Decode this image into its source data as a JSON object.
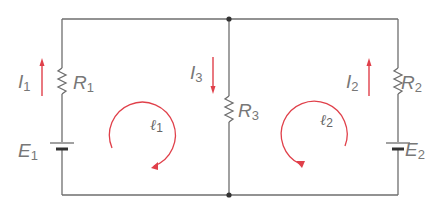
{
  "diagram": {
    "type": "circuit",
    "colors": {
      "wire": "#6e6e6e",
      "current": "#e0404a",
      "label": "#777777"
    },
    "components": {
      "R1": {
        "main": "R",
        "sub": "1"
      },
      "R2": {
        "main": "R",
        "sub": "2"
      },
      "R3": {
        "main": "R",
        "sub": "3"
      },
      "E1": {
        "main": "E",
        "sub": "1"
      },
      "E2": {
        "main": "E",
        "sub": "2"
      }
    },
    "currents": {
      "I1": {
        "main": "I",
        "sub": "1",
        "direction": "up"
      },
      "I2": {
        "main": "I",
        "sub": "2",
        "direction": "up"
      },
      "I3": {
        "main": "I",
        "sub": "3",
        "direction": "down"
      }
    },
    "loops": {
      "l1": {
        "main": "ℓ",
        "sub": "1",
        "direction": "clockwise"
      },
      "l2": {
        "main": "ℓ",
        "sub": "2",
        "direction": "clockwise"
      }
    }
  }
}
